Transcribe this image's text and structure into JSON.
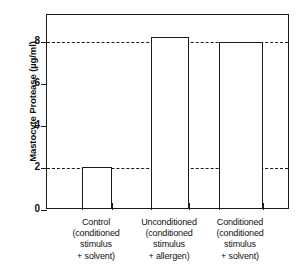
{
  "chart_data": {
    "type": "bar",
    "title": "",
    "xlabel": "",
    "ylabel": "Mastocyte Protease (µg/ml)",
    "ylim": [
      0,
      9.3
    ],
    "yticks": [
      0,
      2,
      4,
      6,
      8
    ],
    "ytick_labels": [
      "0",
      "2",
      "4",
      "6",
      "8"
    ],
    "grid": true,
    "gridlines": [
      2,
      8
    ],
    "legend": "none",
    "categories": [
      "Control (conditioned stimulus + solvent)",
      "Unconditioned (conditioned stimulus + allergen)",
      "Conditioned (conditioned stimulus + solvent)"
    ],
    "category_lines": [
      [
        "Control",
        "(conditioned",
        "stimulus",
        "+ solvent)"
      ],
      [
        "Unconditioned",
        "(conditioned",
        "stimulus",
        "+ allergen)"
      ],
      [
        "Conditioned",
        "(conditioned",
        "stimulus",
        "+ solvent)"
      ]
    ],
    "values": [
      1.95,
      8.15,
      7.9
    ],
    "bar_fill": "#ffffff",
    "bar_edge": "#1a1a1a",
    "axis_color": "#1a1a1a",
    "background": "#ffffff"
  },
  "axis": {
    "y_title": "Mastocyte Protease (µg/ml)"
  }
}
